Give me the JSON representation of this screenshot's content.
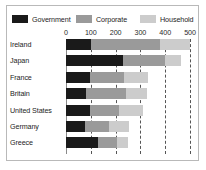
{
  "chart_data": {
    "type": "bar",
    "orientation": "horizontal",
    "stacked": true,
    "title": "",
    "subtitle": "",
    "xlabel": "",
    "ylabel": "",
    "xlim": [
      0,
      500
    ],
    "xticks": [
      0,
      100,
      200,
      300,
      400,
      500
    ],
    "xtick_labels": [
      "0",
      "100",
      "200",
      "300",
      "400",
      "500"
    ],
    "grid": "vertical-dashed",
    "legend_position": "top",
    "categories": [
      "Ireland",
      "Japan",
      "France",
      "Britain",
      "United States",
      "Germany",
      "Greece"
    ],
    "series": [
      {
        "name": "Government",
        "color": "#1a1a1a",
        "values": [
          100,
          230,
          95,
          80,
          95,
          75,
          130
        ]
      },
      {
        "name": "Corporate",
        "color": "#9a9a9a",
        "values": [
          280,
          170,
          140,
          160,
          120,
          100,
          75
        ]
      },
      {
        "name": "Household",
        "color": "#cccccc",
        "values": [
          120,
          65,
          95,
          85,
          95,
          80,
          45
        ]
      }
    ],
    "totals": [
      500,
      465,
      330,
      325,
      310,
      255,
      250
    ]
  },
  "colors": {
    "government": "#1a1a1a",
    "corporate": "#9a9a9a",
    "household": "#cccccc",
    "frame_border": "#b9b9b9",
    "gridline": "#555555",
    "axis": "#8a8a8a",
    "text": "#1d1d1d",
    "background": "#ffffff"
  }
}
